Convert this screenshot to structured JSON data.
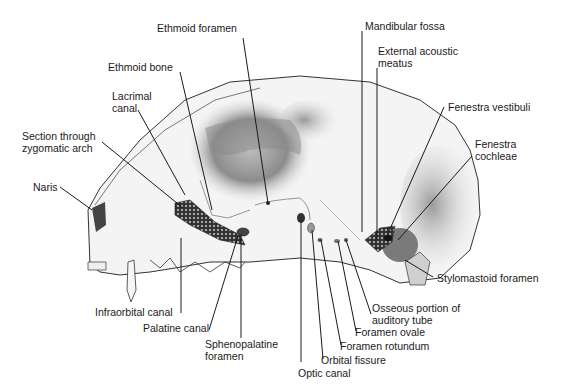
{
  "figure": {
    "labels": [
      {
        "id": "ethmoid-foramen",
        "text": "Ethmoid foramen",
        "x": 157,
        "y": 22
      },
      {
        "id": "ethmoid-bone",
        "text": "Ethmoid bone",
        "x": 108,
        "y": 61
      },
      {
        "id": "lacrimal-canal",
        "text": "Lacrimal\ncanal",
        "x": 112,
        "y": 90
      },
      {
        "id": "section-zygomatic-arch",
        "text": "Section through\nzygomatic arch",
        "x": 22,
        "y": 130
      },
      {
        "id": "naris",
        "text": "Naris",
        "x": 33,
        "y": 181
      },
      {
        "id": "mandibular-fossa",
        "text": "Mandibular fossa",
        "x": 365,
        "y": 20
      },
      {
        "id": "external-acoustic-meatus",
        "text": "External acoustic\nmeatus",
        "x": 378,
        "y": 45
      },
      {
        "id": "fenestra-vestibuli",
        "text": "Fenestra vestibuli",
        "x": 448,
        "y": 101
      },
      {
        "id": "fenestra-cochleae",
        "text": "Fenestra\ncochleae",
        "x": 475,
        "y": 138
      },
      {
        "id": "stylomastoid-foramen",
        "text": "Stylomastoid foramen",
        "x": 437,
        "y": 272
      },
      {
        "id": "osseous-auditory-tube",
        "text": "Osseous portion of\nauditory tube",
        "x": 372,
        "y": 302
      },
      {
        "id": "foramen-ovale",
        "text": "Foramen ovale",
        "x": 355,
        "y": 326
      },
      {
        "id": "foramen-rotundum",
        "text": "Foramen rotundum",
        "x": 340,
        "y": 340
      },
      {
        "id": "orbital-fissure",
        "text": "Orbital fissure",
        "x": 321,
        "y": 354
      },
      {
        "id": "optic-canal",
        "text": "Optic canal",
        "x": 298,
        "y": 367
      },
      {
        "id": "infraorbital-canal",
        "text": "Infraorbital canal",
        "x": 95,
        "y": 306
      },
      {
        "id": "palatine-canal",
        "text": "Palatine canal",
        "x": 143,
        "y": 322
      },
      {
        "id": "sphenopalatine-foramen",
        "text": "Sphenopalatine\nforamen",
        "x": 205,
        "y": 338
      }
    ]
  }
}
